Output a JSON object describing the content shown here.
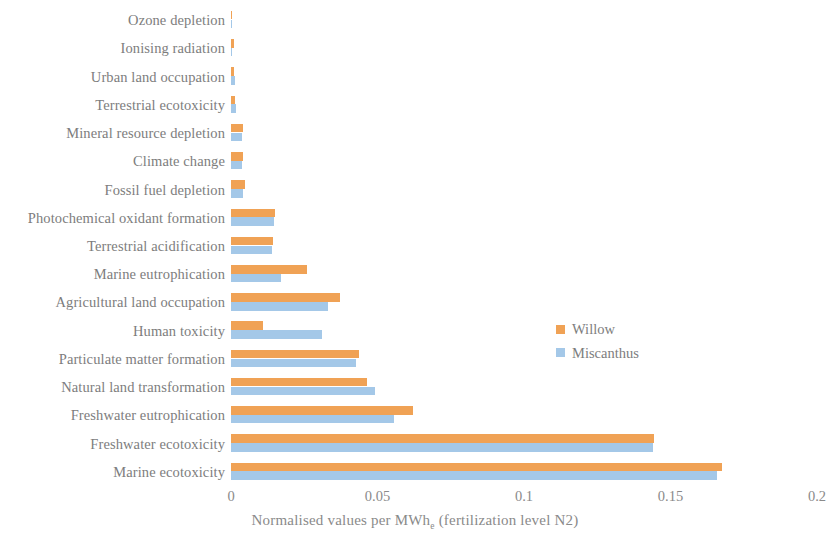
{
  "chart_data": {
    "type": "bar",
    "orientation": "horizontal",
    "title": "",
    "xlabel": "Normalised values per MWhe (fertilization level N2)",
    "xlabel_main": "Normalised values per MWh",
    "xlabel_sub": "e",
    "xlabel_tail": " (fertilization level N2)",
    "ylabel": "",
    "xlim": [
      0,
      0.2
    ],
    "xticks": [
      0,
      0.05,
      0.1,
      0.15,
      0.2
    ],
    "xticklabels": [
      "0",
      "0.05",
      "0.1",
      "0.15",
      "0.2"
    ],
    "grid": false,
    "legend_position": "center-right",
    "categories": [
      "Ozone depletion",
      "Ionising radiation",
      "Urban land occupation",
      "Terrestrial ecotoxicity",
      "Mineral resource depletion",
      "Climate change",
      "Fossil fuel depletion",
      "Photochemical oxidant formation",
      "Terrestrial acidification",
      "Marine eutrophication",
      "Agricultural land occupation",
      "Human toxicity",
      "Particulate matter formation",
      "Natural land transformation",
      "Freshwater eutrophication",
      "Freshwater ecotoxicity",
      "Marine ecotoxicity"
    ],
    "series": [
      {
        "name": "Willow",
        "color": "#F0A255",
        "values": [
          0.0004,
          0.0009,
          0.0011,
          0.0015,
          0.004,
          0.0042,
          0.0048,
          0.015,
          0.0143,
          0.0259,
          0.0372,
          0.0108,
          0.0437,
          0.0465,
          0.062,
          0.1445,
          0.1675
        ]
      },
      {
        "name": "Miscanthus",
        "color": "#A4C8E8",
        "values": [
          0.0002,
          0.0003,
          0.0012,
          0.0016,
          0.0038,
          0.0038,
          0.004,
          0.0148,
          0.014,
          0.0172,
          0.0332,
          0.031,
          0.0427,
          0.049,
          0.0555,
          0.144,
          0.166
        ]
      }
    ]
  },
  "legend": {
    "items": [
      {
        "label": "Willow",
        "color": "#F0A255"
      },
      {
        "label": "Miscanthus",
        "color": "#A4C8E8"
      }
    ]
  }
}
